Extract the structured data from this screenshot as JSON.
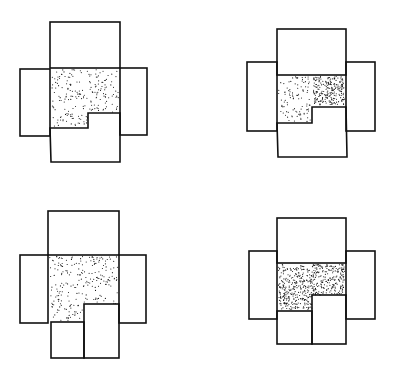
{
  "canvas": {
    "width": 398,
    "height": 372,
    "background": "#ffffff",
    "stroke": "#111111"
  },
  "figures": [
    {
      "id": "figure-top-left",
      "boxes": [
        {
          "name": "top-box",
          "x": 50,
          "y": 22,
          "w": 70,
          "h": 46
        },
        {
          "name": "left-box",
          "x": 20,
          "y": 69,
          "w": 30,
          "h": 67
        },
        {
          "name": "right-box",
          "x": 120,
          "y": 68,
          "w": 27,
          "h": 67
        }
      ],
      "stipple_regions": [
        {
          "name": "center-stipple",
          "points": [
            [
              50,
              68
            ],
            [
              120,
              68
            ],
            [
              120,
              113
            ],
            [
              88,
              113
            ],
            [
              88,
              128
            ],
            [
              50,
              128
            ]
          ],
          "density": 0.055
        }
      ],
      "outlines": [
        {
          "name": "bottom-notched-box",
          "points": [
            [
              50,
              128
            ],
            [
              88,
              128
            ],
            [
              88,
              113
            ],
            [
              120,
              113
            ],
            [
              120,
              162
            ],
            [
              51,
              162
            ]
          ]
        }
      ]
    },
    {
      "id": "figure-top-right",
      "boxes": [
        {
          "name": "top-box",
          "x": 277,
          "y": 29,
          "w": 69,
          "h": 46
        },
        {
          "name": "left-box",
          "x": 247,
          "y": 62,
          "w": 30,
          "h": 69
        },
        {
          "name": "right-box",
          "x": 346,
          "y": 62,
          "w": 29,
          "h": 69
        }
      ],
      "stipple_regions": [
        {
          "name": "sparse-stipple",
          "points": [
            [
              277,
              75
            ],
            [
              312,
              75
            ],
            [
              312,
              123
            ],
            [
              277,
              123
            ]
          ],
          "density": 0.06
        },
        {
          "name": "dense-stipple",
          "points": [
            [
              312,
              75
            ],
            [
              346,
              75
            ],
            [
              346,
              107
            ],
            [
              312,
              107
            ]
          ],
          "density": 0.22
        }
      ],
      "outlines": [
        {
          "name": "bottom-notched-box",
          "points": [
            [
              277,
              123
            ],
            [
              312,
              123
            ],
            [
              312,
              107
            ],
            [
              346,
              107
            ],
            [
              347,
              157
            ],
            [
              278,
              157
            ]
          ]
        }
      ]
    },
    {
      "id": "figure-bottom-left",
      "boxes": [
        {
          "name": "top-box",
          "x": 48,
          "y": 211,
          "w": 71,
          "h": 44
        },
        {
          "name": "left-box",
          "x": 20,
          "y": 255,
          "w": 28,
          "h": 68
        },
        {
          "name": "right-box",
          "x": 119,
          "y": 255,
          "w": 27,
          "h": 68
        },
        {
          "name": "bottom-left-box",
          "x": 51,
          "y": 322,
          "w": 33,
          "h": 36
        },
        {
          "name": "bottom-right-box",
          "x": 84,
          "y": 304,
          "w": 35,
          "h": 54
        }
      ],
      "stipple_regions": [
        {
          "name": "center-stipple",
          "points": [
            [
              48,
              255
            ],
            [
              119,
              255
            ],
            [
              119,
              304
            ],
            [
              84,
              304
            ],
            [
              84,
              322
            ],
            [
              48,
              322
            ]
          ],
          "density": 0.055
        }
      ],
      "outlines": []
    },
    {
      "id": "figure-bottom-right",
      "boxes": [
        {
          "name": "top-box",
          "x": 277,
          "y": 218,
          "w": 69,
          "h": 45
        },
        {
          "name": "left-box",
          "x": 249,
          "y": 251,
          "w": 28,
          "h": 68
        },
        {
          "name": "right-box",
          "x": 346,
          "y": 251,
          "w": 29,
          "h": 68
        },
        {
          "name": "bottom-left-box",
          "x": 277,
          "y": 311,
          "w": 35,
          "h": 33
        },
        {
          "name": "bottom-right-box",
          "x": 312,
          "y": 295,
          "w": 34,
          "h": 49
        }
      ],
      "stipple_regions": [
        {
          "name": "center-stipple",
          "points": [
            [
              277,
              263
            ],
            [
              346,
              263
            ],
            [
              346,
              295
            ],
            [
              312,
              295
            ],
            [
              312,
              311
            ],
            [
              277,
              311
            ]
          ],
          "density": 0.2
        }
      ],
      "outlines": []
    }
  ]
}
